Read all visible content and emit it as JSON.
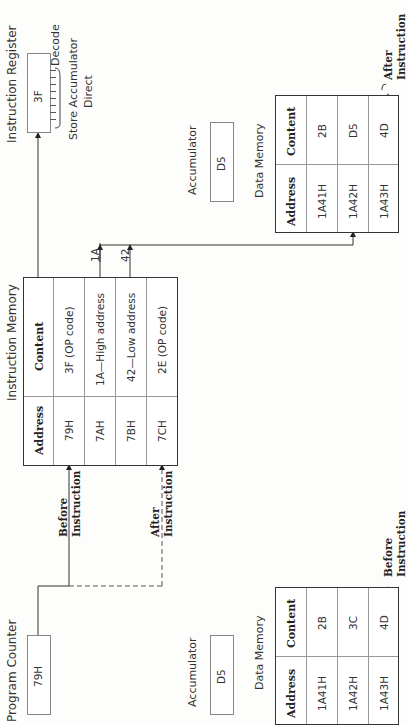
{
  "instruction_register": {
    "title": "Instruction Register",
    "value": "3F",
    "decode_label": "Decode",
    "meaning_line1": "Store Accumulator",
    "meaning_line2": "Direct"
  },
  "instruction_memory": {
    "title": "Instruction Memory",
    "headers": [
      "Address",
      "Content"
    ],
    "rows": [
      {
        "address": "79H",
        "content": "3F (OP code)"
      },
      {
        "address": "7AH",
        "content": "1A—High address"
      },
      {
        "address": "7BH",
        "content": "42—Low address"
      },
      {
        "address": "7CH",
        "content": "2E (OP code)"
      }
    ]
  },
  "bus_labels": {
    "high": "1A",
    "low": "42"
  },
  "program_counter": {
    "title": "Program Counter",
    "value": "79H"
  },
  "arrows": {
    "before": {
      "line1": "Before",
      "line2": "Instruction"
    },
    "after": {
      "line1": "After",
      "line2": "Instruction"
    }
  },
  "after_state": {
    "accumulator": {
      "title": "Accumulator",
      "value": "D5"
    },
    "data_memory": {
      "title": "Data Memory",
      "headers": [
        "Address",
        "Content"
      ],
      "rows": [
        {
          "address": "1A41H",
          "content": "2B"
        },
        {
          "address": "1A42H",
          "content": "D5"
        },
        {
          "address": "1A43H",
          "content": "4D"
        }
      ],
      "brace_line1": "After",
      "brace_line2": "Instruction"
    }
  },
  "before_state": {
    "accumulator": {
      "title": "Accumulator",
      "value": "D5"
    },
    "data_memory": {
      "title": "Data Memory",
      "headers": [
        "Address",
        "Content"
      ],
      "rows": [
        {
          "address": "1A41H",
          "content": "2B"
        },
        {
          "address": "1A42H",
          "content": "3C"
        },
        {
          "address": "1A43H",
          "content": "4D"
        }
      ],
      "brace_line1": "Before",
      "brace_line2": "Instruction"
    }
  }
}
